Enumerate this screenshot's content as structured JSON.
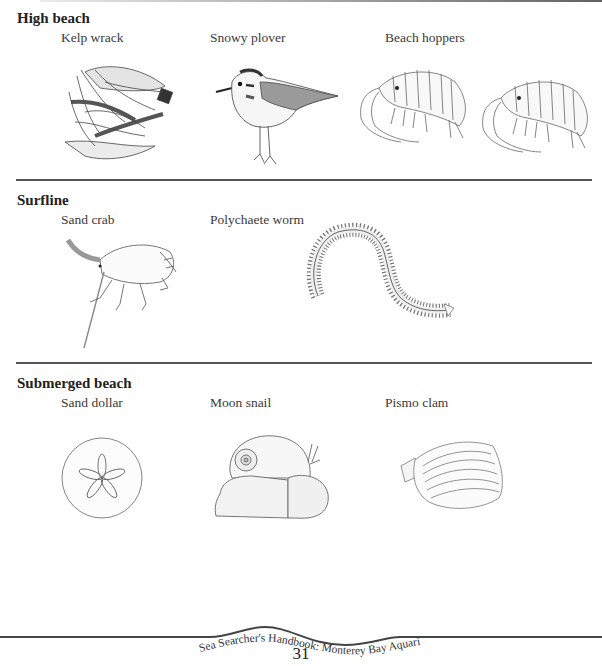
{
  "sections": [
    {
      "title": "High beach",
      "items": [
        {
          "label": "Kelp wrack",
          "illustration": "kelp-wrack-drawing"
        },
        {
          "label": "Snowy plover",
          "illustration": "snowy-plover-drawing"
        },
        {
          "label": "Beach hoppers",
          "illustration": "beach-hoppers-drawing"
        }
      ]
    },
    {
      "title": "Surfline",
      "items": [
        {
          "label": "Sand crab",
          "illustration": "sand-crab-drawing"
        },
        {
          "label": "Polychaete worm",
          "illustration": "polychaete-worm-drawing"
        }
      ]
    },
    {
      "title": "Submerged beach",
      "items": [
        {
          "label": "Sand dollar",
          "illustration": "sand-dollar-drawing"
        },
        {
          "label": "Moon snail",
          "illustration": "moon-snail-drawing"
        },
        {
          "label": "Pismo clam",
          "illustration": "pismo-clam-drawing"
        }
      ]
    }
  ],
  "footer": {
    "book_title": "Sea Searcher's Handbook: Monterey Bay Aquarium",
    "page_number": "31"
  }
}
